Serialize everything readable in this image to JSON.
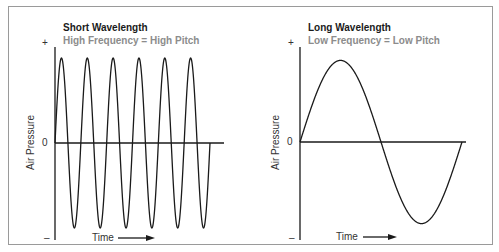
{
  "chart_data": [
    {
      "type": "line",
      "title": "Short Wavelength",
      "subtitle": "High Frequency = High Pitch",
      "xlabel": "Time",
      "ylabel": "Air Pressure",
      "y_ticks": [
        "+",
        "0",
        "–"
      ],
      "series": [
        {
          "name": "sound wave",
          "shape": "sine",
          "cycles": 6,
          "amplitude": 1
        }
      ],
      "x_arrow": true,
      "grid": false
    },
    {
      "type": "line",
      "title": "Long Wavelength",
      "subtitle": "Low Frequency = Low Pitch",
      "xlabel": "Time",
      "ylabel": "Air Pressure",
      "y_ticks": [
        "+",
        "0",
        "–"
      ],
      "series": [
        {
          "name": "sound wave",
          "shape": "sine",
          "cycles": 1,
          "amplitude": 0.85
        }
      ],
      "x_arrow": true,
      "grid": false
    }
  ],
  "panels": {
    "left": {
      "title": "Short Wavelength",
      "subtitle": "High Frequency = High Pitch",
      "tick_plus": "+",
      "tick_zero": "0",
      "tick_minus": "–",
      "ylabel": "Air Pressure",
      "xlabel": "Time"
    },
    "right": {
      "title": "Long Wavelength",
      "subtitle": "Low Frequency = Low Pitch",
      "tick_plus": "+",
      "tick_zero": "0",
      "tick_minus": "–",
      "ylabel": "Air Pressure",
      "xlabel": "Time"
    }
  },
  "colors": {
    "title": "#1a1a1a",
    "subtitle": "#8c8c8c",
    "line": "#1a1a1a",
    "border": "#9a9a9a"
  }
}
